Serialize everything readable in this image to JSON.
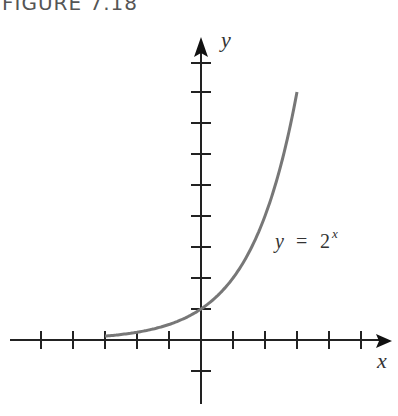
{
  "figure": {
    "title": "FIGURE 7.18"
  },
  "chart_data": {
    "type": "line",
    "title": "FIGURE 7.18",
    "xlabel": "x",
    "ylabel": "y",
    "annotation": "y = 2^x",
    "function": "2^x",
    "x": [
      -3,
      -2,
      -1,
      0,
      1,
      2,
      3
    ],
    "y": [
      0.125,
      0.25,
      0.5,
      1,
      2,
      4,
      8
    ],
    "xlim": [
      -5,
      5.8
    ],
    "ylim": [
      -2,
      9
    ],
    "x_ticks": [
      -5,
      -4,
      -3,
      -2,
      -1,
      1,
      2,
      3,
      4,
      5
    ],
    "y_ticks": [
      -1,
      1,
      2,
      3,
      4,
      5,
      6,
      7,
      8,
      9
    ],
    "grid": false,
    "tick_labels_shown": false,
    "curve_color": "#777777",
    "axis_color": "#222222"
  },
  "labels": {
    "x_axis": "x",
    "y_axis": "y",
    "curve_y": "y",
    "curve_eq": "=",
    "curve_base": "2",
    "curve_exp": "x"
  }
}
